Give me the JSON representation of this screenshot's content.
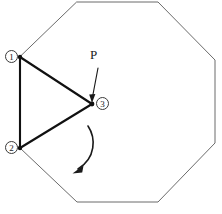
{
  "figure": {
    "type": "geometry-diagram",
    "canvas": {
      "width": 222,
      "height": 214,
      "background": "#ffffff"
    },
    "outline": {
      "name": "octagon",
      "stroke_color": "#6b6b6b",
      "points": "77,2 158,2 215,60 215,143 158,202 77,202 20,148 20,57"
    },
    "triangle": {
      "name": "rotating-triangle",
      "stroke_color": "#111111",
      "points": "20,57 92,104 20,148"
    },
    "vertices": [
      {
        "id": "v1",
        "label": "1",
        "x": 20,
        "y": 57,
        "badge_x": 5,
        "badge_y": 50
      },
      {
        "id": "v2",
        "label": "2",
        "x": 20,
        "y": 148,
        "badge_x": 5,
        "badge_y": 141
      },
      {
        "id": "v3",
        "label": "3",
        "x": 92,
        "y": 104,
        "badge_x": 96,
        "badge_y": 97
      }
    ],
    "point_label": {
      "text": "P",
      "x": 90,
      "y": 48,
      "leader_from": [
        98,
        68
      ],
      "leader_to": [
        92,
        100
      ]
    },
    "rotation_arrow": {
      "direction": "clockwise-downward",
      "path": "M 88,126 C 96,138 96,158 77,170",
      "arrow_tip": [
        73,
        173
      ]
    }
  }
}
